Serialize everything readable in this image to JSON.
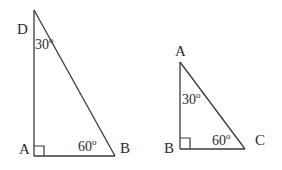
{
  "figure": {
    "stroke_color": "#3a3a3a",
    "text_color": "#2b2b2b",
    "background_color": "#ffffff"
  },
  "triangles": [
    {
      "name": "triangle-DAB",
      "vertices": [
        {
          "id": "D",
          "label": "D",
          "x": 34,
          "y": 10
        },
        {
          "id": "A",
          "label": "A",
          "x": 34,
          "y": 156
        },
        {
          "id": "B",
          "label": "B",
          "x": 115,
          "y": 156
        }
      ],
      "angles": [
        {
          "at": "D",
          "value": "30",
          "unit": "o",
          "text": "30o"
        },
        {
          "at": "A",
          "value": "90",
          "unit": "o",
          "text": "right-angle-mark"
        },
        {
          "at": "B",
          "value": "60",
          "unit": "o",
          "text": "60o"
        }
      ]
    },
    {
      "name": "triangle-ABC",
      "vertices": [
        {
          "id": "A",
          "label": "A",
          "x": 180,
          "y": 62
        },
        {
          "id": "B",
          "label": "B",
          "x": 180,
          "y": 149
        },
        {
          "id": "C",
          "label": "C",
          "x": 245,
          "y": 149
        }
      ],
      "angles": [
        {
          "at": "A",
          "value": "30",
          "unit": "o",
          "text": "30o"
        },
        {
          "at": "B",
          "value": "90",
          "unit": "o",
          "text": "right-angle-mark"
        },
        {
          "at": "C",
          "value": "60",
          "unit": "o",
          "text": "60o"
        }
      ]
    }
  ],
  "labels": {
    "left": {
      "apex": "D",
      "right_angle_vertex": "A",
      "base_right": "B",
      "angle_apex": "30",
      "angle_apex_unit": "o",
      "angle_base": "60",
      "angle_base_unit": "o"
    },
    "right": {
      "apex": "A",
      "right_angle_vertex": "B",
      "base_right": "C",
      "angle_apex": "30",
      "angle_apex_unit": "o",
      "angle_base": "60",
      "angle_base_unit": "o"
    }
  }
}
